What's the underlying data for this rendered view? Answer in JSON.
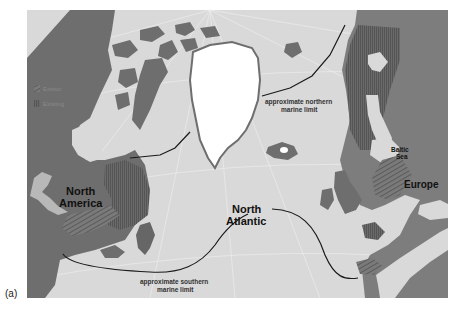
{
  "figure": {
    "panel_label": "(a)",
    "colors": {
      "sea": "#d9d9d9",
      "land_existing": "#6e6e6e",
      "land_light": "#9a9a9a",
      "ice": "#ffffff",
      "limit_line": "#1a1a1a",
      "graticule": "#ececec"
    }
  },
  "legend": {
    "items": [
      {
        "label": "Extinct",
        "pattern": "diagonal-hatch"
      },
      {
        "label": "Existing",
        "pattern": "vertical-hatch"
      }
    ]
  },
  "labels": {
    "north_america_1": "North",
    "north_america_2": "America",
    "north_atlantic_1": "North",
    "north_atlantic_2": "Atlantic",
    "europe": "Europe",
    "baltic_1": "Baltic",
    "baltic_2": "Sea",
    "northern_limit_1": "approximate northern",
    "northern_limit_2": "marine limit",
    "southern_limit_1": "approximate southern",
    "southern_limit_2": "marine limit"
  }
}
